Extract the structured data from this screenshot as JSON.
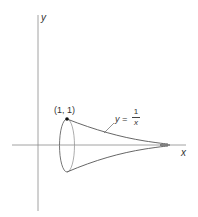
{
  "figure": {
    "axes": {
      "x_label": "x",
      "y_label": "y"
    },
    "point_label": "(1, 1)",
    "curve_label": {
      "lhs": "y =",
      "numerator": "1",
      "denominator": "x"
    },
    "colors": {
      "axis": "#8a8a8a",
      "curve": "#555555",
      "point": "#111111",
      "text": "#333333"
    }
  }
}
